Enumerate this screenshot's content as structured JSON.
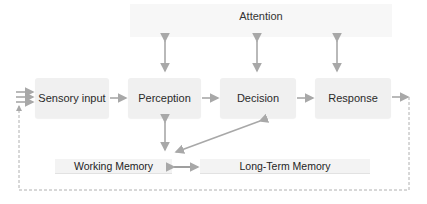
{
  "diagram": {
    "attention": {
      "label": "Attention"
    },
    "nodes": [
      {
        "id": "sensory",
        "label": "Sensory input"
      },
      {
        "id": "perception",
        "label": "Perception"
      },
      {
        "id": "decision",
        "label": "Decision"
      },
      {
        "id": "response",
        "label": "Response"
      }
    ],
    "memory": {
      "working": {
        "label": "Working Memory"
      },
      "long_term": {
        "label": "Long-Term Memory"
      }
    },
    "edges": [
      {
        "from": "input",
        "to": "sensory",
        "style": "triple-arrow"
      },
      {
        "from": "sensory",
        "to": "perception",
        "style": "arrow"
      },
      {
        "from": "perception",
        "to": "decision",
        "style": "arrow"
      },
      {
        "from": "decision",
        "to": "response",
        "style": "arrow"
      },
      {
        "from": "attention",
        "to": "perception",
        "style": "bidirectional"
      },
      {
        "from": "attention",
        "to": "decision",
        "style": "bidirectional"
      },
      {
        "from": "attention",
        "to": "response",
        "style": "bidirectional"
      },
      {
        "from": "perception",
        "to": "working",
        "style": "bidirectional"
      },
      {
        "from": "decision",
        "to": "working",
        "style": "bidirectional-diagonal"
      },
      {
        "from": "working",
        "to": "long_term",
        "style": "bidirectional"
      },
      {
        "from": "response",
        "to": "sensory",
        "style": "dashed-feedback"
      }
    ],
    "colors": {
      "box": "#f0f0f0",
      "arrow": "#a8a8a8",
      "text": "#2a2a2a"
    }
  }
}
